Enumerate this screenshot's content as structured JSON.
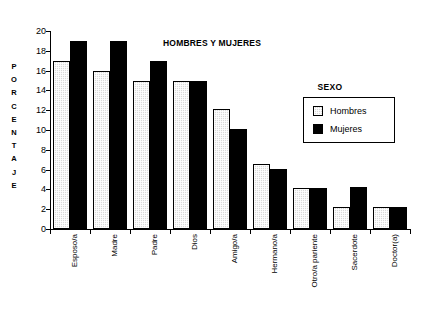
{
  "chart_data": {
    "type": "bar",
    "title": "HOMBRES Y MUJERES",
    "xlabel": "",
    "ylabel": "PORCENTAJE",
    "ylim": [
      0,
      20
    ],
    "yticks": [
      0,
      2,
      4,
      6,
      8,
      10,
      12,
      14,
      16,
      18,
      20
    ],
    "grid": false,
    "legend_position": "right",
    "legend_title": "SEXO",
    "categories": [
      "Esposo/a",
      "Madre",
      "Padre",
      "Dios",
      "Amigo/a",
      "Hermano/a",
      "Otro/a pariente",
      "Sacerdote",
      "Doctor(a)"
    ],
    "series": [
      {
        "name": "Hombres",
        "color": "#d9d9d9",
        "values": [
          17,
          16,
          15,
          15,
          12.1,
          6.6,
          4.1,
          2.2,
          2.2
        ]
      },
      {
        "name": "Mujeres",
        "color": "#000000",
        "values": [
          19,
          19,
          17,
          15,
          10.1,
          6.1,
          4.1,
          4.2,
          2.2
        ]
      }
    ]
  },
  "y_axis_title_letters": [
    "P",
    "O",
    "R",
    "C",
    "E",
    "N",
    "T",
    "A",
    "J",
    "E"
  ]
}
